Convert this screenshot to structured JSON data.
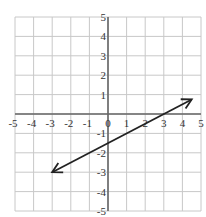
{
  "chart_data": {
    "type": "line",
    "title": "",
    "xlabel": "",
    "ylabel": "",
    "xlim": [
      -5,
      5
    ],
    "ylim": [
      -5,
      5
    ],
    "grid": true,
    "x_ticks": [
      "-5",
      "-4",
      "-3",
      "-2",
      "-1",
      "0",
      "1",
      "2",
      "3",
      "4",
      "5"
    ],
    "y_ticks": [
      "5",
      "4",
      "3",
      "2",
      "1",
      "-1",
      "-2",
      "-3",
      "-4",
      "-5"
    ],
    "series": [
      {
        "name": "line",
        "description": "Line with arrows on both ends, slope 1/2, y-intercept -1.5",
        "x": [
          -3,
          4.5
        ],
        "y": [
          -3,
          0.75
        ],
        "arrows": "both"
      }
    ],
    "equation": "y = 0.5x - 1.5",
    "colors": {
      "grid": "#c8c8c8",
      "axis": "#666666",
      "line": "#222222"
    }
  }
}
